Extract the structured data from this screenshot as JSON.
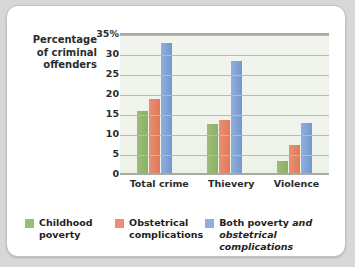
{
  "chart_data": {
    "type": "bar",
    "title": "",
    "xlabel": "",
    "ylabel": "Percentage of criminal offenders",
    "ylabel_lines": [
      "Percentage",
      "of criminal",
      "offenders"
    ],
    "categories": [
      "Total crime",
      "Thievery",
      "Violence"
    ],
    "series": [
      {
        "name": "Childhood poverty",
        "color": "#9cbd78",
        "values": [
          15.5,
          12.3,
          3.0
        ]
      },
      {
        "name": "Obstetrical complications",
        "color": "#ea8f72",
        "values": [
          18.6,
          13.2,
          7.0
        ]
      },
      {
        "name": "Both poverty and obstetrical complications",
        "color": "#8fb0dd",
        "values": [
          32.5,
          28.0,
          12.5
        ]
      }
    ],
    "ylim": [
      0,
      35
    ],
    "yticks": [
      0,
      5,
      10,
      15,
      20,
      25,
      30,
      35
    ],
    "ytick_labels": [
      "0",
      "5",
      "10",
      "15",
      "20",
      "25",
      "30",
      "35%"
    ],
    "grid": true,
    "legend_position": "bottom"
  },
  "legend": {
    "items": [
      {
        "label_line1": "Childhood",
        "label_line2": "poverty",
        "color": "#9cbd78"
      },
      {
        "label_line1": "Obstetrical",
        "label_line2": "complications",
        "color": "#ea8f72"
      },
      {
        "label_line1_a": "Both poverty ",
        "label_line1_em": "and",
        "label_line2": "obstetrical complications",
        "color": "#8fb0dd"
      }
    ]
  }
}
